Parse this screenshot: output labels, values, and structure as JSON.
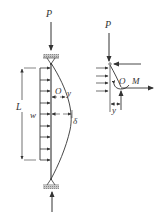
{
  "figure": {
    "left_diagram": {
      "axial_load_label": "P",
      "length_label": "L",
      "distributed_load_label": "w",
      "section_point_label": "O",
      "deflection_coordinate_label": "y",
      "max_deflection_label": "δ"
    },
    "right_diagram": {
      "axial_load_label": "P",
      "section_point_label": "O",
      "moment_label": "M",
      "deflection_label": "y"
    },
    "colors": {
      "line": "#333333",
      "support_hatch": "#9a9a9a",
      "background": "#ffffff"
    }
  }
}
